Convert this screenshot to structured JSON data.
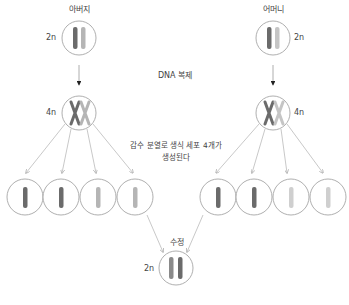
{
  "labels": {
    "father": "아버지",
    "mother": "어머니",
    "dna_replication": "DNA 복제",
    "meiosis_line1": "감수 분열로 생식 세포 4개가",
    "meiosis_line2": "생성된다",
    "fertilization": "수정",
    "father_ploidy": "2n",
    "mother_ploidy": "2n",
    "father_replicated_ploidy": "4n",
    "mother_replicated_ploidy": "4n",
    "zygote_ploidy": "2n"
  },
  "colors": {
    "dark_chromosome": "#6b6b6b",
    "light_chromosome": "#b5b5b5",
    "cell_outline": "#9a9a9a",
    "arrow_light": "#b0b0b0",
    "arrow_dark": "#222222"
  },
  "nodes": [
    {
      "id": "father",
      "ploidy": "2n"
    },
    {
      "id": "mother",
      "ploidy": "2n"
    },
    {
      "id": "father-replicated",
      "ploidy": "4n"
    },
    {
      "id": "mother-replicated",
      "ploidy": "4n"
    },
    {
      "id": "father-gametes",
      "count": 4
    },
    {
      "id": "mother-gametes",
      "count": 4
    },
    {
      "id": "zygote",
      "ploidy": "2n"
    }
  ]
}
